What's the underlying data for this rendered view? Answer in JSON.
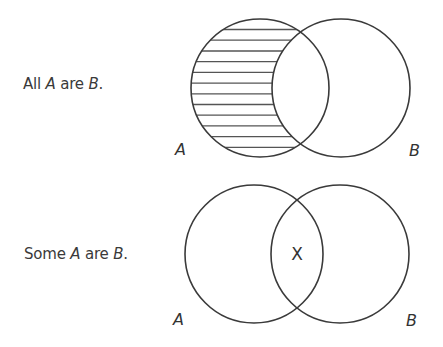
{
  "diagrams": [
    {
      "statement": {
        "prefix": "All ",
        "subject": "A",
        "middle": " are ",
        "predicate": "B",
        "suffix": "."
      },
      "circle_a_label": "A",
      "circle_b_label": "B",
      "shading": "A minus B (horizontal hatch)",
      "mark": ""
    },
    {
      "statement": {
        "prefix": "Some ",
        "subject": "A",
        "middle": " are ",
        "predicate": "B",
        "suffix": "."
      },
      "circle_a_label": "A",
      "circle_b_label": "B",
      "shading": "none",
      "mark": "X"
    }
  ],
  "colors": {
    "stroke": "#3a3a3a",
    "hatch": "#555555",
    "text": "#3a3a3a",
    "background": "#ffffff"
  }
}
